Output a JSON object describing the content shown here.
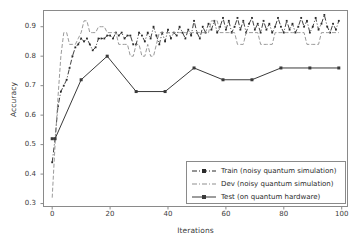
{
  "chart_data": {
    "type": "line",
    "title": "",
    "xlabel": "Iterations",
    "ylabel": "Accuracy",
    "xlim": [
      -3,
      102
    ],
    "ylim": [
      0.29,
      0.955
    ],
    "grid": false,
    "legend_position": "lower right",
    "xticks": [
      0,
      20,
      40,
      60,
      80,
      100
    ],
    "yticks": [
      0.3,
      0.4,
      0.5,
      0.6,
      0.7,
      0.8,
      0.9
    ],
    "xtick_labels": [
      "0",
      "20",
      "40",
      "60",
      "80",
      "100"
    ],
    "ytick_labels": [
      "0.3",
      "0.4",
      "0.5",
      "0.6",
      "0.7",
      "0.8",
      "0.9"
    ],
    "series": [
      {
        "name": "Train (noisy quantum simulation)",
        "legend_label": "Train (noisy quantum simulation)",
        "color": "#2b2b2b",
        "linestyle": "dashdot",
        "marker": "square",
        "x": [
          0,
          1,
          2,
          3,
          4,
          5,
          6,
          7,
          8,
          9,
          10,
          11,
          12,
          13,
          14,
          15,
          16,
          17,
          18,
          19,
          20,
          21,
          22,
          23,
          24,
          25,
          26,
          27,
          28,
          29,
          30,
          31,
          32,
          33,
          34,
          35,
          36,
          37,
          38,
          39,
          40,
          41,
          42,
          43,
          44,
          45,
          46,
          47,
          48,
          49,
          50,
          51,
          52,
          53,
          54,
          55,
          56,
          57,
          58,
          59,
          60,
          61,
          62,
          63,
          64,
          65,
          66,
          67,
          68,
          69,
          70,
          71,
          72,
          73,
          74,
          75,
          76,
          77,
          78,
          79,
          80,
          81,
          82,
          83,
          84,
          85,
          86,
          87,
          88,
          89,
          90,
          91,
          92,
          93,
          94,
          95,
          96,
          97,
          98,
          99
        ],
        "y": [
          0.44,
          0.52,
          0.63,
          0.68,
          0.7,
          0.72,
          0.76,
          0.8,
          0.83,
          0.84,
          0.86,
          0.85,
          0.86,
          0.84,
          0.82,
          0.83,
          0.86,
          0.86,
          0.86,
          0.87,
          0.87,
          0.86,
          0.88,
          0.87,
          0.88,
          0.86,
          0.87,
          0.87,
          0.84,
          0.84,
          0.88,
          0.87,
          0.85,
          0.88,
          0.86,
          0.9,
          0.87,
          0.84,
          0.88,
          0.85,
          0.89,
          0.86,
          0.88,
          0.87,
          0.9,
          0.88,
          0.86,
          0.89,
          0.87,
          0.92,
          0.88,
          0.86,
          0.9,
          0.88,
          0.91,
          0.89,
          0.92,
          0.88,
          0.9,
          0.93,
          0.89,
          0.92,
          0.88,
          0.9,
          0.93,
          0.89,
          0.92,
          0.88,
          0.91,
          0.93,
          0.89,
          0.91,
          0.88,
          0.92,
          0.89,
          0.91,
          0.88,
          0.9,
          0.93,
          0.9,
          0.88,
          0.92,
          0.89,
          0.91,
          0.88,
          0.9,
          0.93,
          0.9,
          0.92,
          0.88,
          0.9,
          0.93,
          0.89,
          0.91,
          0.94,
          0.9,
          0.88,
          0.91,
          0.89,
          0.92
        ]
      },
      {
        "name": "Dev (noisy quantum simulation)",
        "legend_label": "Dev (noisy quantum simulation)",
        "color": "#8f8f8f",
        "linestyle": "dashed",
        "marker": "none",
        "x": [
          0,
          1,
          2,
          3,
          4,
          5,
          6,
          7,
          8,
          9,
          10,
          11,
          12,
          13,
          14,
          15,
          16,
          17,
          18,
          19,
          20,
          21,
          22,
          23,
          24,
          25,
          26,
          27,
          28,
          29,
          30,
          31,
          32,
          33,
          34,
          35,
          36,
          37,
          38,
          39,
          40,
          41,
          42,
          43,
          44,
          45,
          46,
          47,
          48,
          49,
          50,
          51,
          52,
          53,
          54,
          55,
          56,
          57,
          58,
          59,
          60,
          61,
          62,
          63,
          64,
          65,
          66,
          67,
          68,
          69,
          70,
          71,
          72,
          73,
          74,
          75,
          76,
          77,
          78,
          79,
          80,
          81,
          82,
          83,
          84,
          85,
          86,
          87,
          88,
          89,
          90,
          91,
          92,
          93,
          94,
          95,
          96,
          97,
          98,
          99
        ],
        "y": [
          0.32,
          0.5,
          0.66,
          0.8,
          0.88,
          0.88,
          0.84,
          0.84,
          0.84,
          0.86,
          0.88,
          0.92,
          0.92,
          0.88,
          0.88,
          0.88,
          0.9,
          0.9,
          0.9,
          0.88,
          0.88,
          0.88,
          0.88,
          0.84,
          0.84,
          0.84,
          0.84,
          0.8,
          0.8,
          0.84,
          0.84,
          0.8,
          0.8,
          0.84,
          0.8,
          0.8,
          0.84,
          0.88,
          0.88,
          0.88,
          0.88,
          0.88,
          0.88,
          0.88,
          0.88,
          0.88,
          0.88,
          0.88,
          0.88,
          0.88,
          0.88,
          0.88,
          0.88,
          0.88,
          0.88,
          0.92,
          0.92,
          0.92,
          0.88,
          0.88,
          0.88,
          0.88,
          0.88,
          0.88,
          0.84,
          0.84,
          0.84,
          0.88,
          0.88,
          0.88,
          0.88,
          0.88,
          0.84,
          0.84,
          0.84,
          0.84,
          0.84,
          0.88,
          0.88,
          0.88,
          0.88,
          0.88,
          0.88,
          0.88,
          0.88,
          0.88,
          0.88,
          0.88,
          0.84,
          0.84,
          0.84,
          0.84,
          0.84,
          0.88,
          0.88,
          0.88,
          0.88,
          0.88,
          0.88,
          0.88
        ]
      },
      {
        "name": "Test (on quantum hardware)",
        "legend_label": "Test (on quantum hardware)",
        "color": "#3a3a3a",
        "linestyle": "solid",
        "marker": "square",
        "x": [
          0,
          1,
          10,
          19,
          29,
          39,
          49,
          59,
          69,
          79,
          89,
          99
        ],
        "y": [
          0.52,
          0.52,
          0.72,
          0.8,
          0.68,
          0.68,
          0.76,
          0.72,
          0.72,
          0.76,
          0.76,
          0.76
        ]
      }
    ]
  },
  "axes": {
    "ylabel": "Accuracy",
    "xlabel": "Iterations"
  }
}
